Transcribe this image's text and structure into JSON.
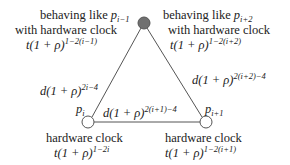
{
  "diagram": {
    "type": "triangle-graph",
    "nodes": {
      "top": {
        "fill": "#707070",
        "line1": "behaving like ",
        "var_base": "p",
        "var_sub": "i−1",
        "line2": "with hardware clock",
        "formula_base": "t(1 + ρ)",
        "formula_exp": "1−2(i−1)",
        "right_line1": "behaving like ",
        "right_var_base": "p",
        "right_var_sub": "i+2",
        "right_line2": "with hardware clock",
        "right_formula_base": "t(1 + ρ)",
        "right_formula_exp": "1−2(i+2)"
      },
      "bottom_left": {
        "fill": "#ffffff",
        "name_base": "p",
        "name_sub": "i",
        "line1": "hardware clock",
        "formula_base": "t(1 + ρ)",
        "formula_exp": "1−2i"
      },
      "bottom_right": {
        "fill": "#ffffff",
        "name_base": "p",
        "name_sub": "i+1",
        "line1": "hardware clock",
        "formula_base": "t(1 + ρ)",
        "formula_exp": "1−2(i+1)"
      }
    },
    "edges": {
      "left": {
        "base": "d(1 + ρ)",
        "exp": "2i−4"
      },
      "right": {
        "base": "d(1 + ρ)",
        "exp": "2(i+2)−4"
      },
      "bottom": {
        "base": "d(1 + ρ)",
        "exp": "2(i+1)−4"
      }
    }
  }
}
